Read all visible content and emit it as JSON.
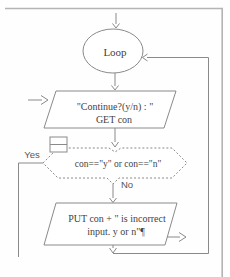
{
  "page": {
    "background": "#ffffff",
    "frame_border_color": "#b4b4b4"
  },
  "flowchart": {
    "line_color": "#8a8a8a",
    "text_color": "#3f3f3f",
    "nodes": {
      "loop": {
        "shape": "terminator-ellipse",
        "label": "Loop"
      },
      "prompt_input": {
        "shape": "io-parallelogram",
        "line1": "\"Continue?(y/n) : \"",
        "line2": "GET con"
      },
      "condition": {
        "shape": "decision-hexagon-dotted",
        "label": "con==\"y\" or con==\"n\""
      },
      "error_output": {
        "shape": "io-parallelogram",
        "line1": "PUT con + \" is incorrect",
        "line2": "input. y or n\"¶"
      }
    },
    "branch_labels": {
      "yes": "Yes",
      "no": "No"
    }
  }
}
